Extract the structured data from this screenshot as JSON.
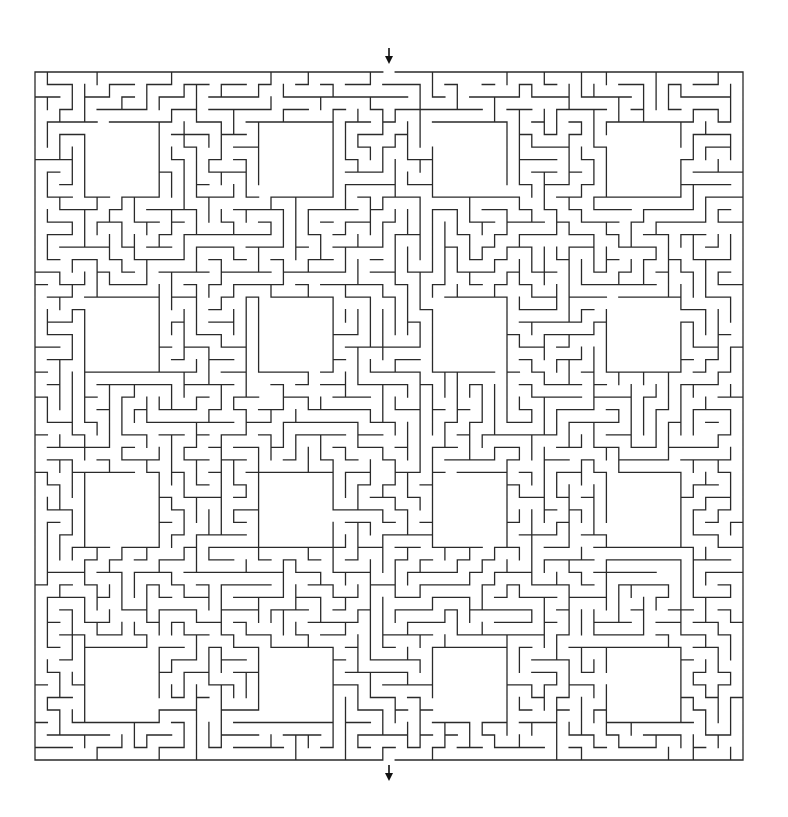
{
  "puzzle": {
    "type": "maze",
    "grid": {
      "cols": 57,
      "rows": 55
    },
    "bounds": {
      "left": 35,
      "top": 72,
      "right": 743,
      "bottom": 760
    },
    "entrance": {
      "side": "top",
      "col": 28,
      "arrow": "down-arrow"
    },
    "exit": {
      "side": "bottom",
      "col": 28,
      "arrow": "down-arrow"
    },
    "rooms": {
      "cols_start": [
        4,
        18,
        32,
        46
      ],
      "rows_start": [
        4,
        18,
        32,
        46
      ],
      "size": {
        "w": 6,
        "h": 6
      }
    },
    "wall_color": "#2a2a2a",
    "background_color": "#ffffff",
    "seed": 20240611
  }
}
